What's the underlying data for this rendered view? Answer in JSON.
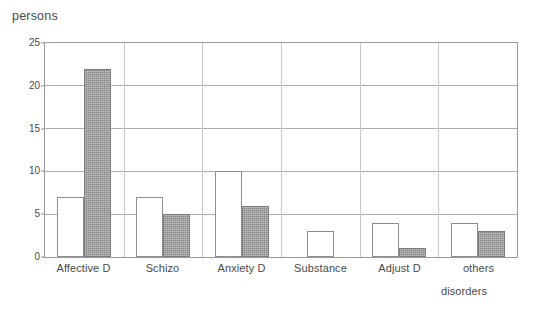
{
  "chart_data": {
    "type": "bar",
    "title": "",
    "xlabel": "disorders",
    "ylabel": "persons",
    "categories": [
      "Affective D",
      "Schizo",
      "Anxiety D",
      "Substance",
      "Adjust D",
      "others"
    ],
    "series": [
      {
        "name": "series-1",
        "style": "white",
        "values": [
          7,
          7,
          10,
          3,
          4,
          4
        ]
      },
      {
        "name": "series-2",
        "style": "gray",
        "values": [
          22,
          5,
          6,
          0,
          1,
          3
        ]
      }
    ],
    "ylim": [
      0,
      25
    ],
    "yticks": [
      0,
      5,
      10,
      15,
      20,
      25
    ],
    "ytick_labels": [
      "0",
      "5",
      "10",
      "15",
      "20",
      "25"
    ],
    "grid": true,
    "legend": "none",
    "colors": {
      "series_1_fill": "#ffffff",
      "series_1_stroke": "#8e8e8e",
      "series_2_fill": "#9b9b9b",
      "series_2_stroke": "#7d7d7d",
      "gridline": "#adadad",
      "frame": "#9a9a9a",
      "text": "#4a4a4a"
    }
  }
}
